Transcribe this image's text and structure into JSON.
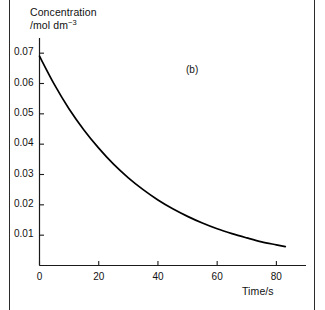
{
  "figure": {
    "panel_tag": "(b)",
    "y_axis_label_line1": "Concentration",
    "y_axis_label_line2_prefix": "/mol dm",
    "y_axis_label_line2_sup": "−3",
    "x_axis_label": "Time/s"
  },
  "chart_data": {
    "type": "line",
    "title": "",
    "subtitle": "",
    "annotations": [
      "(b)"
    ],
    "xlabel": "Time/s",
    "ylabel": "Concentration /mol dm−3",
    "xlim": [
      0,
      90
    ],
    "ylim": [
      0,
      0.075
    ],
    "grid": false,
    "legend": null,
    "xticks": [
      0,
      20,
      40,
      60,
      80
    ],
    "xtick_labels": [
      "0",
      "20",
      "40",
      "60",
      "80"
    ],
    "yticks": [
      0.01,
      0.02,
      0.03,
      0.04,
      0.05,
      0.06,
      0.07
    ],
    "ytick_labels": [
      "0.01",
      "0.02",
      "0.03",
      "0.04",
      "0.05",
      "0.06",
      "0.07"
    ],
    "series": [
      {
        "name": "concentration decay",
        "color": "#000000",
        "x": [
          0,
          5,
          10,
          15,
          20,
          25,
          30,
          35,
          40,
          45,
          50,
          55,
          60,
          65,
          70,
          75,
          80,
          83
        ],
        "y": [
          0.069,
          0.0597,
          0.0516,
          0.0447,
          0.0387,
          0.0334,
          0.0289,
          0.025,
          0.0216,
          0.0187,
          0.0162,
          0.014,
          0.0121,
          0.0105,
          0.0091,
          0.0078,
          0.0068,
          0.0062
        ]
      }
    ]
  },
  "colors": {
    "curve": "#000000",
    "axis": "#1a1a1a",
    "page_rule": "#2b2b2b",
    "background": "#ffffff"
  }
}
